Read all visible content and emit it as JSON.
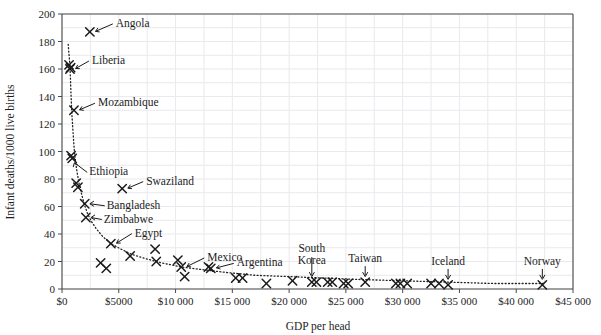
{
  "chart_data": {
    "type": "scatter",
    "title": "",
    "xlabel": "GDP per head",
    "ylabel": "Infant deaths/1000 live births",
    "xlim": [
      0,
      45000
    ],
    "ylim": [
      0,
      200
    ],
    "grid": true,
    "legend": "none",
    "xticks": [
      0,
      5000,
      10000,
      15000,
      20000,
      25000,
      30000,
      35000,
      40000,
      45000
    ],
    "xtick_labels": [
      "$0",
      "$5000",
      "$10 000",
      "$15 000",
      "$20 000",
      "$25 000",
      "$30 000",
      "$35 000",
      "$40 000",
      "$45 000"
    ],
    "yticks": [
      0,
      20,
      40,
      60,
      80,
      100,
      120,
      140,
      160,
      180,
      200
    ],
    "ytick_labels": [
      "0",
      "20",
      "40",
      "60",
      "80",
      "100",
      "120",
      "140",
      "160",
      "180",
      "200"
    ],
    "marker": "x",
    "trend_line": {
      "style": "dotted",
      "color": "#222222",
      "points": [
        [
          550,
          178
        ],
        [
          700,
          163
        ],
        [
          760,
          150
        ],
        [
          800,
          140
        ],
        [
          860,
          128
        ],
        [
          940,
          118
        ],
        [
          1020,
          108
        ],
        [
          1100,
          99
        ],
        [
          1200,
          92
        ],
        [
          1350,
          84
        ],
        [
          1500,
          77
        ],
        [
          1700,
          70
        ],
        [
          1950,
          62
        ],
        [
          2250,
          55
        ],
        [
          2600,
          49
        ],
        [
          3000,
          44
        ],
        [
          3600,
          38
        ],
        [
          4300,
          33
        ],
        [
          5200,
          29
        ],
        [
          6200,
          25
        ],
        [
          7400,
          22
        ],
        [
          8800,
          19
        ],
        [
          10500,
          16
        ],
        [
          12500,
          14
        ],
        [
          14500,
          12
        ],
        [
          17000,
          10
        ],
        [
          20000,
          9
        ],
        [
          23000,
          8
        ],
        [
          26000,
          7
        ],
        [
          30000,
          6
        ],
        [
          34000,
          5
        ],
        [
          38000,
          4
        ],
        [
          42500,
          4
        ]
      ]
    },
    "points": [
      {
        "x": 2450,
        "y": 187,
        "label": "Angola",
        "label_dx": 26,
        "label_dy": -9
      },
      {
        "x": 620,
        "y": 163,
        "label": "",
        "label_dx": 0,
        "label_dy": 0
      },
      {
        "x": 700,
        "y": 160,
        "label": "Liberia",
        "label_dx": 22,
        "label_dy": -9
      },
      {
        "x": 760,
        "y": 161,
        "label": "",
        "label_dx": 0,
        "label_dy": 0
      },
      {
        "x": 1050,
        "y": 130,
        "label": "Mozambique",
        "label_dx": 24,
        "label_dy": -8
      },
      {
        "x": 800,
        "y": 97,
        "label": "",
        "label_dx": 0,
        "label_dy": 0
      },
      {
        "x": 900,
        "y": 95,
        "label": "Ethiopia",
        "label_dx": 17,
        "label_dy": 13
      },
      {
        "x": 1250,
        "y": 77,
        "label": "",
        "label_dx": 0,
        "label_dy": 0
      },
      {
        "x": 1400,
        "y": 74,
        "label": "",
        "label_dx": 0,
        "label_dy": 0
      },
      {
        "x": 2000,
        "y": 62,
        "label": "Bangladesh",
        "label_dx": 22,
        "label_dy": 1
      },
      {
        "x": 2100,
        "y": 52,
        "label": "Zimbabwe",
        "label_dx": 18,
        "label_dy": 1
      },
      {
        "x": 5300,
        "y": 73,
        "label": "Swaziland",
        "label_dx": 24,
        "label_dy": -8
      },
      {
        "x": 4300,
        "y": 33,
        "label": "Egypt",
        "label_dx": 24,
        "label_dy": -11
      },
      {
        "x": 3400,
        "y": 19,
        "label": "",
        "label_dx": 0,
        "label_dy": 0
      },
      {
        "x": 3900,
        "y": 15,
        "label": "",
        "label_dx": 0,
        "label_dy": 0
      },
      {
        "x": 6000,
        "y": 24,
        "label": "",
        "label_dx": 0,
        "label_dy": 0
      },
      {
        "x": 8200,
        "y": 29,
        "label": "",
        "label_dx": 0,
        "label_dy": 0
      },
      {
        "x": 8300,
        "y": 20,
        "label": "",
        "label_dx": 0,
        "label_dy": 0
      },
      {
        "x": 10200,
        "y": 21,
        "label": "",
        "label_dx": 0,
        "label_dy": 0
      },
      {
        "x": 10500,
        "y": 16,
        "label": "Mexico",
        "label_dx": 26,
        "label_dy": -10
      },
      {
        "x": 10800,
        "y": 9,
        "label": "",
        "label_dx": 0,
        "label_dy": 0
      },
      {
        "x": 12900,
        "y": 16,
        "label": "",
        "label_dx": 0,
        "label_dy": 0
      },
      {
        "x": 13100,
        "y": 15,
        "label": "Argentina",
        "label_dx": 26,
        "label_dy": -6
      },
      {
        "x": 15300,
        "y": 8,
        "label": "",
        "label_dx": 0,
        "label_dy": 0
      },
      {
        "x": 15900,
        "y": 8,
        "label": "",
        "label_dx": 0,
        "label_dy": 0
      },
      {
        "x": 18000,
        "y": 4,
        "label": "",
        "label_dx": 0,
        "label_dy": 0
      },
      {
        "x": 20300,
        "y": 6,
        "label": "",
        "label_dx": 0,
        "label_dy": 0
      },
      {
        "x": 22000,
        "y": 5,
        "label": "South Korea",
        "label_dx": 0,
        "label_dy": -30
      },
      {
        "x": 22400,
        "y": 5,
        "label": "",
        "label_dx": 0,
        "label_dy": 0
      },
      {
        "x": 23400,
        "y": 5,
        "label": "",
        "label_dx": 0,
        "label_dy": 0
      },
      {
        "x": 23800,
        "y": 5,
        "label": "",
        "label_dx": 0,
        "label_dy": 0
      },
      {
        "x": 24800,
        "y": 4,
        "label": "",
        "label_dx": 0,
        "label_dy": 0
      },
      {
        "x": 25200,
        "y": 4,
        "label": "",
        "label_dx": 0,
        "label_dy": 0
      },
      {
        "x": 26700,
        "y": 5,
        "label": "Taiwan",
        "label_dx": 0,
        "label_dy": -20
      },
      {
        "x": 29400,
        "y": 4,
        "label": "",
        "label_dx": 0,
        "label_dy": 0
      },
      {
        "x": 29800,
        "y": 4,
        "label": "",
        "label_dx": 0,
        "label_dy": 0
      },
      {
        "x": 30400,
        "y": 4,
        "label": "",
        "label_dx": 0,
        "label_dy": 0
      },
      {
        "x": 32500,
        "y": 4,
        "label": "",
        "label_dx": 0,
        "label_dy": 0
      },
      {
        "x": 33200,
        "y": 4,
        "label": "",
        "label_dx": 0,
        "label_dy": 0
      },
      {
        "x": 34000,
        "y": 3,
        "label": "Iceland",
        "label_dx": 0,
        "label_dy": -20
      },
      {
        "x": 42300,
        "y": 3,
        "label": "Norway",
        "label_dx": 0,
        "label_dy": -20
      }
    ],
    "annotated_labels": [
      "Angola",
      "Liberia",
      "Mozambique",
      "Ethiopia",
      "Bangladesh",
      "Zimbabwe",
      "Swaziland",
      "Egypt",
      "Mexico",
      "Argentina",
      "South Korea",
      "Taiwan",
      "Iceland",
      "Norway"
    ]
  },
  "plot": {
    "left": 62,
    "top": 14,
    "right": 573,
    "bottom": 289,
    "grid_color": "#e9e9ee",
    "axis_color": "#4a4a4a",
    "marker_color": "#1a1a1a"
  }
}
